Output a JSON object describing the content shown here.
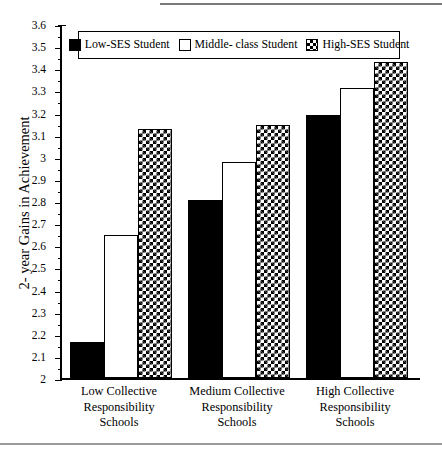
{
  "chart_data": {
    "type": "bar",
    "title": "",
    "xlabel": "",
    "ylabel": "2- year Gains in Achievement",
    "ylim": [
      2,
      3.6
    ],
    "grid": false,
    "legend_position": "top-center",
    "categories": [
      "Low Collective\nResponsibility\nSchools",
      "Medium Collective\nResponsibility\nSchools",
      "High Collective\nResponsibility\nSchools"
    ],
    "series": [
      {
        "name": "Low-SES Student",
        "fill": "solid-black",
        "color": "#000000",
        "values": [
          2.165,
          2.805,
          3.19
        ]
      },
      {
        "name": "Middle- class Student",
        "fill": "white-outline",
        "color": "#ffffff",
        "values": [
          2.645,
          2.975,
          3.31
        ]
      },
      {
        "name": "High-SES Student",
        "fill": "checkered",
        "color": "#000000",
        "values": [
          3.125,
          3.145,
          3.43
        ]
      }
    ],
    "ytick_labels": [
      "3.6",
      "3.5",
      "3.4",
      "3.3",
      "3.2",
      "3.1",
      "3",
      "2.9",
      "2.8",
      "2.7",
      "2.6",
      "2.5",
      "2.4",
      "2.3",
      "2.2",
      "2.1",
      "2"
    ],
    "ytick_values": [
      3.6,
      3.5,
      3.4,
      3.3,
      3.2,
      3.1,
      3.0,
      2.9,
      2.8,
      2.7,
      2.6,
      2.5,
      2.4,
      2.3,
      2.2,
      2.1,
      2.0
    ]
  },
  "axis": {
    "y_title": "2- year Gains in Achievement"
  },
  "legend": {
    "items": [
      {
        "label": "Low-SES Student",
        "swatch": "solid-black-swatch"
      },
      {
        "label": "Middle- class Student",
        "swatch": "white-outline-swatch"
      },
      {
        "label": "High-SES Student",
        "swatch": "checkered-swatch"
      }
    ]
  }
}
